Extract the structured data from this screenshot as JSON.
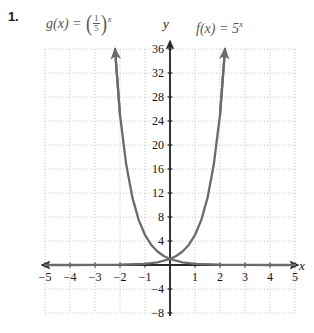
{
  "problem": {
    "number": "1."
  },
  "labels": {
    "g": {
      "name": "g",
      "arg": "(x)",
      "eq": "=",
      "num": "1",
      "den": "5",
      "exp": "x",
      "open": "(",
      "close": ")"
    },
    "f": {
      "text": "f(x) = 5",
      "exp": "x"
    },
    "axis_x": "x",
    "axis_y": "y"
  },
  "chart_data": {
    "type": "line",
    "title": "",
    "xlabel": "x",
    "ylabel": "y",
    "xlim": [
      -5,
      5
    ],
    "ylim": [
      -8,
      36
    ],
    "grid": true,
    "grid_step_x": 1,
    "grid_step_y": 4,
    "xticks": [
      -5,
      -4,
      -3,
      -2,
      -1,
      1,
      2,
      3,
      4,
      5
    ],
    "xtick_labels": [
      "-5",
      "-4",
      "-3",
      "-2",
      "-1",
      "1",
      "2",
      "3",
      "4",
      "5"
    ],
    "yticks": [
      -8,
      -4,
      4,
      8,
      12,
      16,
      20,
      24,
      28,
      32,
      36
    ],
    "ytick_labels": [
      "-8",
      "-4",
      "4",
      "8",
      "12",
      "16",
      "20",
      "24",
      "28",
      "32",
      "36"
    ],
    "legend_position": "above-axes",
    "curve_color": "#6b6b6b",
    "axis_color": "#2b2b2b",
    "grid_color": "#c9c9c9",
    "series": [
      {
        "name": "g(x) = (1/5)^x",
        "formula": "(1/5)^x",
        "base": 0.2,
        "label_position": "top-left",
        "arrow_end": "up-left",
        "points": [
          {
            "x": -2.2,
            "y": 36.0
          },
          {
            "x": -2.0,
            "y": 25.0
          },
          {
            "x": -1.75,
            "y": 16.7
          },
          {
            "x": -1.5,
            "y": 11.18
          },
          {
            "x": -1.25,
            "y": 7.48
          },
          {
            "x": -1.0,
            "y": 5.0
          },
          {
            "x": -0.75,
            "y": 3.34
          },
          {
            "x": -0.5,
            "y": 2.24
          },
          {
            "x": -0.25,
            "y": 1.5
          },
          {
            "x": 0,
            "y": 1.0
          },
          {
            "x": 0.5,
            "y": 0.447
          },
          {
            "x": 1,
            "y": 0.2
          },
          {
            "x": 2,
            "y": 0.04
          },
          {
            "x": 3,
            "y": 0.008
          },
          {
            "x": 4,
            "y": 0.0016
          },
          {
            "x": 5,
            "y": 0.0003
          }
        ]
      },
      {
        "name": "f(x) = 5^x",
        "formula": "5^x",
        "base": 5,
        "label_position": "top-right",
        "arrow_end": "up-right",
        "points": [
          {
            "x": -5,
            "y": 0.0003
          },
          {
            "x": -4,
            "y": 0.0016
          },
          {
            "x": -3,
            "y": 0.008
          },
          {
            "x": -2,
            "y": 0.04
          },
          {
            "x": -1,
            "y": 0.2
          },
          {
            "x": -0.5,
            "y": 0.447
          },
          {
            "x": 0,
            "y": 1.0
          },
          {
            "x": 0.25,
            "y": 1.5
          },
          {
            "x": 0.5,
            "y": 2.24
          },
          {
            "x": 0.75,
            "y": 3.34
          },
          {
            "x": 1.0,
            "y": 5.0
          },
          {
            "x": 1.25,
            "y": 7.48
          },
          {
            "x": 1.5,
            "y": 11.18
          },
          {
            "x": 1.75,
            "y": 16.7
          },
          {
            "x": 2.0,
            "y": 25.0
          },
          {
            "x": 2.2,
            "y": 36.0
          }
        ]
      }
    ],
    "intersection": {
      "x": 0,
      "y": 1
    }
  }
}
